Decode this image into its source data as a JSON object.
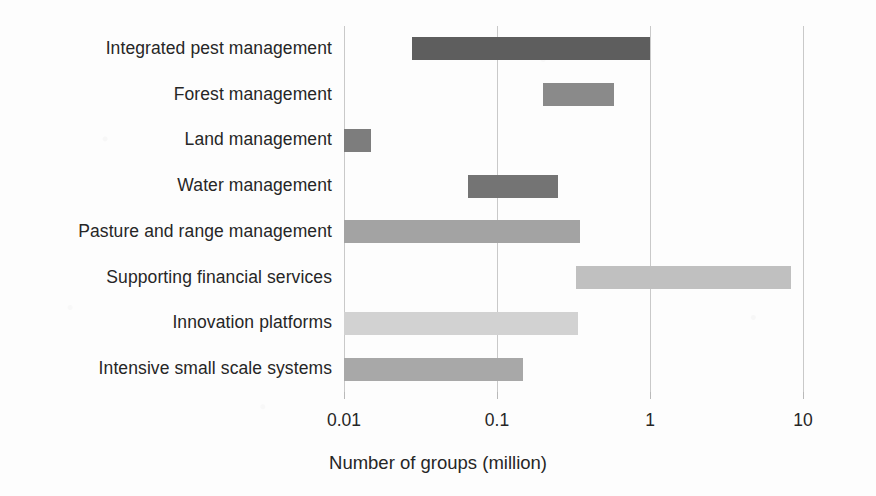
{
  "chart_data": {
    "type": "bar",
    "orientation": "horizontal",
    "subtype": "floating-range-bar",
    "title": "",
    "xlabel": "Number of groups (million)",
    "ylabel": "",
    "xscale": "log",
    "xlim": [
      0.01,
      10
    ],
    "xticks": [
      0.01,
      0.1,
      1,
      10
    ],
    "xtick_labels": [
      "0.01",
      "0.1",
      "1",
      "10"
    ],
    "grid": "vertical",
    "legend": "none",
    "categories": [
      "Integrated pest management",
      "Forest management",
      "Land management",
      "Water management",
      "Pasture and range management",
      "Supporting financial services",
      "Innovation platforms",
      "Intensive small scale systems"
    ],
    "bars": [
      {
        "category": "Integrated pest management",
        "low": 0.028,
        "high": 1.0,
        "color": "#5e5e5e"
      },
      {
        "category": "Forest management",
        "low": 0.2,
        "high": 0.58,
        "color": "#8a8a8a"
      },
      {
        "category": "Land management",
        "low": 0.01,
        "high": 0.015,
        "color": "#7d7d7d"
      },
      {
        "category": "Water management",
        "low": 0.065,
        "high": 0.25,
        "color": "#747474"
      },
      {
        "category": "Pasture and range management",
        "low": 0.01,
        "high": 0.35,
        "color": "#a3a3a3"
      },
      {
        "category": "Supporting financial services",
        "low": 0.33,
        "high": 8.4,
        "color": "#c0c0c0"
      },
      {
        "category": "Innovation platforms",
        "low": 0.01,
        "high": 0.34,
        "color": "#d2d2d2"
      },
      {
        "category": "Intensive small scale systems",
        "low": 0.01,
        "high": 0.148,
        "color": "#a8a8a8"
      }
    ]
  },
  "axis": {
    "title": "Number of groups (million)",
    "tick_labels": [
      "0.01",
      "0.1",
      "1",
      "10"
    ]
  },
  "colors": {
    "gridline": "#c9c9c9",
    "text": "#262626",
    "background": "#fdfdfd"
  }
}
